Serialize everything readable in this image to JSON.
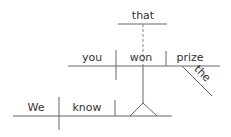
{
  "diagram": {
    "type": "sentence-diagram",
    "sentence": "We know that you won the prize",
    "words": {
      "that": "that",
      "you": "you",
      "won": "won",
      "prize": "prize",
      "the": "the",
      "we": "We",
      "know": "know"
    },
    "colors": {
      "line": "#555555",
      "text": "#333333",
      "background": "#ffffff"
    }
  }
}
